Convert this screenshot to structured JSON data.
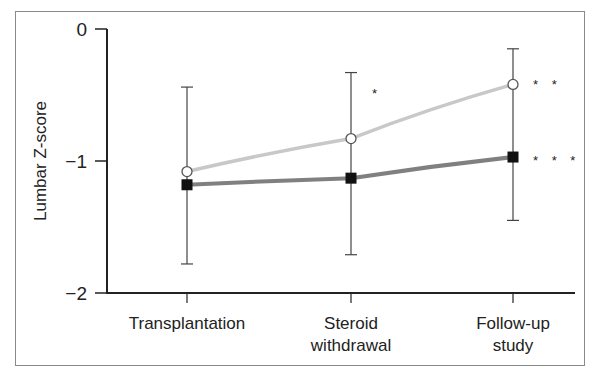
{
  "chart_data": {
    "type": "line",
    "title": "",
    "xlabel": "",
    "ylabel": "Lumbar Z-score",
    "ylim": [
      -2,
      0
    ],
    "yticks": [
      0,
      -1,
      -2
    ],
    "ytick_labels": [
      "0",
      "−1",
      "−2"
    ],
    "grid": false,
    "legend": null,
    "categories": [
      "Transplantation",
      "Steroid withdrawal",
      "Follow-up study"
    ],
    "category_lines": [
      [
        "Transplantation"
      ],
      [
        "Steroid",
        "withdrawal"
      ],
      [
        "Follow-up",
        "study"
      ]
    ],
    "series": [
      {
        "name": "open-circle series",
        "marker": "open-circle",
        "color": "#c8c8c8",
        "values": [
          -1.08,
          -0.83,
          -0.42
        ],
        "error_upper": [
          -0.44,
          -0.33,
          -0.15
        ],
        "annotations": [
          "",
          "*",
          "**"
        ]
      },
      {
        "name": "filled-square series",
        "marker": "filled-square",
        "color": "#808080",
        "values": [
          -1.18,
          -1.13,
          -0.97
        ],
        "error_lower": [
          -1.78,
          -1.71,
          -1.45
        ],
        "annotations": [
          "",
          "",
          "***"
        ]
      }
    ]
  }
}
